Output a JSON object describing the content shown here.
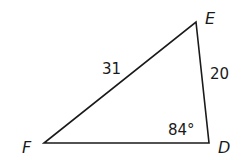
{
  "diagram": {
    "type": "triangle",
    "vertices": [
      {
        "name": "E",
        "x": 196,
        "y": 22
      },
      {
        "name": "D",
        "x": 209,
        "y": 143
      },
      {
        "name": "F",
        "x": 44,
        "y": 143
      }
    ],
    "labels": {
      "vertex_e": "E",
      "vertex_d": "D",
      "vertex_f": "F",
      "side_fe": "31",
      "side_ed": "20",
      "angle_d": "84°"
    },
    "stroke_color": "#1a1a1a",
    "background": "#ffffff"
  }
}
